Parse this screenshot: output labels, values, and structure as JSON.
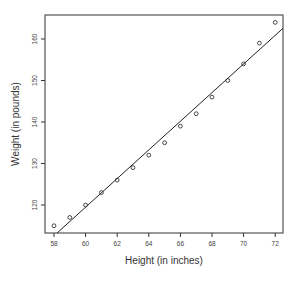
{
  "chart_data": {
    "type": "scatter",
    "title": "",
    "xlabel": "Height (in inches)",
    "ylabel": "Weight (in pounds)",
    "xlim": [
      57.43,
      72.49
    ],
    "ylim": [
      112.9,
      165.5
    ],
    "x_ticks": [
      58,
      60,
      62,
      64,
      66,
      68,
      70,
      72
    ],
    "y_ticks": [
      120,
      130,
      140,
      150,
      160
    ],
    "grid": false,
    "legend": null,
    "series": [
      {
        "name": "observations",
        "marker": "open-circle",
        "x": [
          58,
          59,
          60,
          61,
          62,
          63,
          64,
          65,
          66,
          67,
          68,
          69,
          70,
          71,
          72
        ],
        "y": [
          115,
          117,
          120,
          123,
          126,
          129,
          132,
          135,
          139,
          142,
          146,
          150,
          154,
          159,
          164
        ]
      }
    ],
    "fit_line": {
      "name": "least-squares regression line",
      "intercept": -87.52,
      "slope": 3.45
    },
    "colors": {
      "points": "#333333",
      "line": "#222222",
      "frame": "#333333"
    }
  }
}
